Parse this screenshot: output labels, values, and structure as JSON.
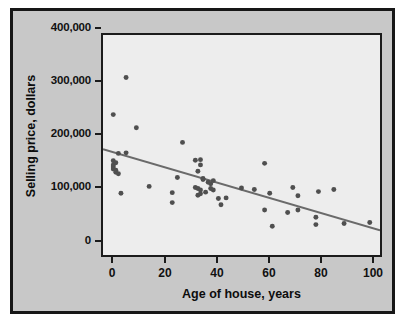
{
  "chart_data": {
    "type": "scatter",
    "title": "",
    "xlabel": "Age of house, years",
    "ylabel": "Selling price, dollars",
    "xlim": [
      -4,
      104
    ],
    "ylim": [
      0,
      420000
    ],
    "xticks": [
      0,
      20,
      40,
      60,
      80,
      100
    ],
    "xticklabels": [
      "0",
      "20",
      "40",
      "60",
      "80",
      "100"
    ],
    "yticks": [
      0,
      100000,
      200000,
      300000,
      400000
    ],
    "yticklabels": [
      "0",
      "100,000",
      "200,000",
      "300,000",
      "400,000"
    ],
    "grid": false,
    "legend": null,
    "marker_color": "#4f4f4f",
    "plot_background": "#ededed",
    "figure_background": "#c8c8c8",
    "series": [
      {
        "name": "Houses",
        "type": "scatter",
        "points": [
          [
            0,
            268000
          ],
          [
            0,
            180000
          ],
          [
            0,
            172000
          ],
          [
            0,
            168000
          ],
          [
            0,
            164000
          ],
          [
            1,
            176000
          ],
          [
            1,
            162000
          ],
          [
            1,
            158000
          ],
          [
            2,
            194000
          ],
          [
            2,
            155000
          ],
          [
            3,
            118000
          ],
          [
            5,
            339000
          ],
          [
            5,
            195000
          ],
          [
            9,
            243000
          ],
          [
            14,
            131000
          ],
          [
            23,
            119000
          ],
          [
            23,
            100000
          ],
          [
            25,
            148000
          ],
          [
            27,
            215000
          ],
          [
            32,
            181000
          ],
          [
            32,
            129000
          ],
          [
            33,
            160000
          ],
          [
            33,
            127000
          ],
          [
            33,
            114000
          ],
          [
            34,
            182000
          ],
          [
            34,
            172000
          ],
          [
            34,
            124000
          ],
          [
            34,
            117000
          ],
          [
            35,
            146000
          ],
          [
            35,
            144000
          ],
          [
            36,
            120000
          ],
          [
            37,
            139000
          ],
          [
            38,
            136000
          ],
          [
            38,
            127000
          ],
          [
            39,
            142000
          ],
          [
            39,
            124000
          ],
          [
            41,
            108000
          ],
          [
            42,
            96000
          ],
          [
            44,
            109000
          ],
          [
            50,
            128000
          ],
          [
            55,
            125000
          ],
          [
            59,
            175000
          ],
          [
            59,
            86000
          ],
          [
            61,
            118000
          ],
          [
            62,
            55000
          ],
          [
            68,
            81000
          ],
          [
            70,
            129000
          ],
          [
            72,
            113000
          ],
          [
            72,
            86000
          ],
          [
            79,
            72000
          ],
          [
            79,
            58000
          ],
          [
            80,
            121000
          ],
          [
            86,
            125000
          ],
          [
            90,
            60000
          ],
          [
            100,
            62000
          ]
        ]
      },
      {
        "name": "Least-squares regression line",
        "type": "line",
        "points": [
          [
            -4,
            202000
          ],
          [
            104,
            47000
          ]
        ]
      }
    ]
  }
}
